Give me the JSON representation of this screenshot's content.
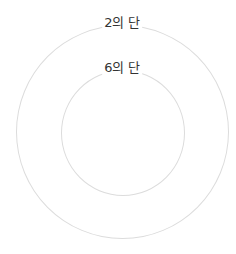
{
  "diagram": {
    "type": "concentric-circles",
    "stroke_color": "#dcdcdc",
    "label_color": "#333333",
    "rings": [
      {
        "id": "outer",
        "label": "2의 단"
      },
      {
        "id": "inner",
        "label": "6의 단"
      }
    ]
  }
}
